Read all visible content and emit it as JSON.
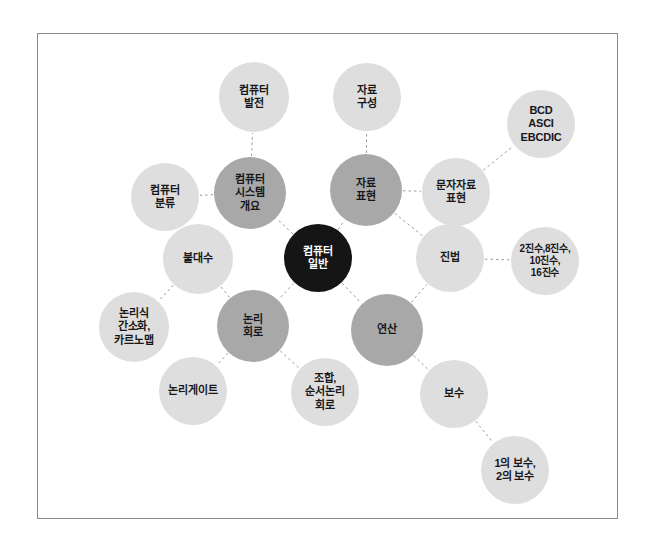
{
  "diagram": {
    "frame": {
      "x": 37,
      "y": 33,
      "width": 581,
      "height": 486,
      "border_color": "#8d8d8d"
    },
    "background_color": "#ffffff",
    "edge_color": "#9a9a9a",
    "edge_style": "dashed",
    "palette": {
      "center": "#151516",
      "center_text": "#ffffff",
      "branch_dark": "#a8a8a8",
      "branch_mid": "#b9b9b9",
      "leaf_light": "#dedede",
      "leaf_lighter": "#e3e3e3",
      "text": "#17171a"
    },
    "nodes": [
      {
        "id": "center",
        "label": "컴퓨터\n일반",
        "cx": 318,
        "cy": 258,
        "r": 34,
        "fill": "#151516",
        "text_color": "#ffffff",
        "font_size": 11,
        "level": 0
      },
      {
        "id": "sys-overview",
        "label": "컴퓨터\n시스템\n개요",
        "cx": 250,
        "cy": 193,
        "r": 36,
        "fill": "#a8a8a8",
        "text_color": "#17171a",
        "font_size": 11,
        "level": 1
      },
      {
        "id": "data-repr",
        "label": "자료\n표현",
        "cx": 366,
        "cy": 190,
        "r": 36,
        "fill": "#a8a8a8",
        "text_color": "#17171a",
        "font_size": 11,
        "level": 1
      },
      {
        "id": "logic-circuit",
        "label": "논리\n회로",
        "cx": 253,
        "cy": 326,
        "r": 36,
        "fill": "#a8a8a8",
        "text_color": "#17171a",
        "font_size": 11,
        "level": 1
      },
      {
        "id": "operation",
        "label": "연산",
        "cx": 387,
        "cy": 330,
        "r": 36,
        "fill": "#a8a8a8",
        "text_color": "#17171a",
        "font_size": 11,
        "level": 1
      },
      {
        "id": "comp-dev",
        "label": "컴퓨터\n발전",
        "cx": 254,
        "cy": 97,
        "r": 35,
        "fill": "#dedede",
        "text_color": "#17171a",
        "font_size": 11,
        "level": 2
      },
      {
        "id": "data-struct",
        "label": "자료\n구성",
        "cx": 367,
        "cy": 97,
        "r": 34,
        "fill": "#dedede",
        "text_color": "#17171a",
        "font_size": 11,
        "level": 2
      },
      {
        "id": "comp-class",
        "label": "컴퓨터\n분류",
        "cx": 165,
        "cy": 197,
        "r": 34,
        "fill": "#dedede",
        "text_color": "#17171a",
        "font_size": 11,
        "level": 2
      },
      {
        "id": "bool-algebra",
        "label": "불대수",
        "cx": 198,
        "cy": 259,
        "r": 35,
        "fill": "#dedede",
        "text_color": "#17171a",
        "font_size": 11,
        "level": 2
      },
      {
        "id": "char-repr",
        "label": "문자자료\n표현",
        "cx": 456,
        "cy": 192,
        "r": 34,
        "fill": "#dedede",
        "text_color": "#17171a",
        "font_size": 11,
        "level": 2
      },
      {
        "id": "codes",
        "label": "BCD\nASCI\nEBCDIC",
        "cx": 541,
        "cy": 124,
        "r": 34,
        "fill": "#dedede",
        "text_color": "#17171a",
        "font_size": 11,
        "level": 3
      },
      {
        "id": "radix",
        "label": "진법",
        "cx": 450,
        "cy": 258,
        "r": 34,
        "fill": "#dedede",
        "text_color": "#17171a",
        "font_size": 11,
        "level": 2
      },
      {
        "id": "radix-kinds",
        "label": "2진수,8진수,\n10진수,\n16진수",
        "cx": 545,
        "cy": 261,
        "r": 34,
        "fill": "#dedede",
        "text_color": "#17171a",
        "font_size": 10,
        "level": 3
      },
      {
        "id": "simplify",
        "label": "논리식\n간소화,\n카르노맵",
        "cx": 134,
        "cy": 327,
        "r": 35,
        "fill": "#dedede",
        "text_color": "#17171a",
        "font_size": 11,
        "level": 3
      },
      {
        "id": "logic-gate",
        "label": "논리게이트",
        "cx": 193,
        "cy": 391,
        "r": 34,
        "fill": "#dedede",
        "text_color": "#17171a",
        "font_size": 11,
        "level": 3
      },
      {
        "id": "comb-seq",
        "label": "조합,\n순서논리\n회로",
        "cx": 325,
        "cy": 392,
        "r": 34,
        "fill": "#dedede",
        "text_color": "#17171a",
        "font_size": 11,
        "level": 3
      },
      {
        "id": "complement",
        "label": "보수",
        "cx": 454,
        "cy": 394,
        "r": 34,
        "fill": "#dedede",
        "text_color": "#17171a",
        "font_size": 11,
        "level": 2
      },
      {
        "id": "complement12",
        "label": "1의 보수,\n2의 보수",
        "cx": 515,
        "cy": 470,
        "r": 34,
        "fill": "#dedede",
        "text_color": "#17171a",
        "font_size": 11,
        "level": 3
      }
    ],
    "edges": [
      {
        "from": "center",
        "to": "sys-overview"
      },
      {
        "from": "center",
        "to": "data-repr"
      },
      {
        "from": "center",
        "to": "logic-circuit"
      },
      {
        "from": "center",
        "to": "operation"
      },
      {
        "from": "sys-overview",
        "to": "comp-dev"
      },
      {
        "from": "sys-overview",
        "to": "comp-class"
      },
      {
        "from": "data-repr",
        "to": "data-struct"
      },
      {
        "from": "data-repr",
        "to": "char-repr"
      },
      {
        "from": "char-repr",
        "to": "codes"
      },
      {
        "from": "data-repr",
        "to": "radix"
      },
      {
        "from": "radix",
        "to": "radix-kinds"
      },
      {
        "from": "logic-circuit",
        "to": "bool-algebra"
      },
      {
        "from": "bool-algebra",
        "to": "simplify"
      },
      {
        "from": "logic-circuit",
        "to": "logic-gate"
      },
      {
        "from": "logic-circuit",
        "to": "comb-seq"
      },
      {
        "from": "operation",
        "to": "radix"
      },
      {
        "from": "operation",
        "to": "complement"
      },
      {
        "from": "complement",
        "to": "complement12"
      }
    ]
  }
}
